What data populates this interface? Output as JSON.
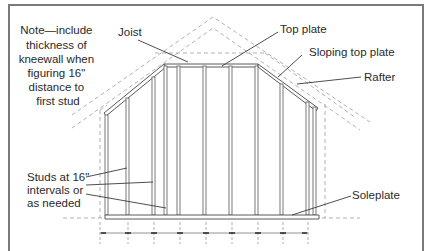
{
  "diagram": {
    "type": "kneewall-framing",
    "note": {
      "lines": [
        "Note—include",
        "thickness of",
        "kneewall when",
        "figuring 16\"",
        "distance to",
        "first stud"
      ]
    },
    "labels": {
      "joist": "Joist",
      "top_plate": "Top plate",
      "sloping_top_plate": "Sloping top plate",
      "rafter": "Rafter",
      "soleplate": "Soleplate",
      "studs": [
        "Studs at 16\"",
        "intervals or",
        "as needed"
      ]
    },
    "colors": {
      "line": "#5a5a5a",
      "dashed": "#a8a8a8",
      "text": "#2a2a2a",
      "frame": "#7a7a7a"
    }
  }
}
